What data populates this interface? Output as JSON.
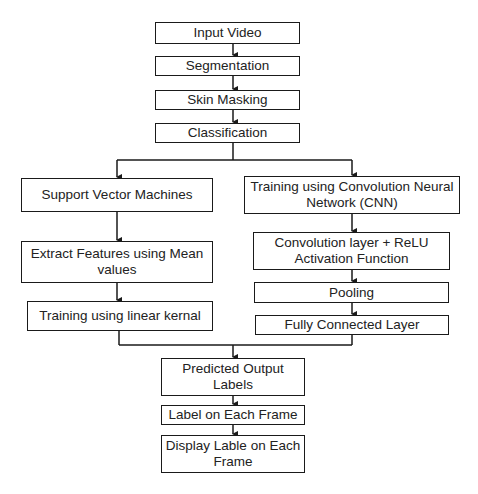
{
  "diagram": {
    "type": "flowchart",
    "nodes": {
      "input_video": "Input Video",
      "segmentation": "Segmentation",
      "skin_masking": "Skin Masking",
      "classification": "Classification",
      "svm": "Support Vector Machines",
      "extract_features": "Extract Features using Mean values",
      "linear_kernel": "Training using linear kernal",
      "cnn": "Training using Convolution Neural Network (CNN)",
      "conv_relu": "Convolution layer + ReLU Activation Function",
      "pooling": "Pooling",
      "fully_connected": "Fully Connected Layer",
      "predicted_labels": "Predicted Output Labels",
      "label_each_frame": "Label on Each Frame",
      "display_label": "Display Lable on Each Frame"
    },
    "edges": [
      [
        "input_video",
        "segmentation"
      ],
      [
        "segmentation",
        "skin_masking"
      ],
      [
        "skin_masking",
        "classification"
      ],
      [
        "classification",
        "svm"
      ],
      [
        "classification",
        "cnn"
      ],
      [
        "svm",
        "extract_features"
      ],
      [
        "extract_features",
        "linear_kernel"
      ],
      [
        "cnn",
        "conv_relu"
      ],
      [
        "conv_relu",
        "pooling"
      ],
      [
        "pooling",
        "fully_connected"
      ],
      [
        "linear_kernel",
        "predicted_labels"
      ],
      [
        "fully_connected",
        "predicted_labels"
      ],
      [
        "predicted_labels",
        "label_each_frame"
      ],
      [
        "label_each_frame",
        "display_label"
      ]
    ],
    "colors": {
      "stroke": "#1a1a1a",
      "fill": "#ffffff",
      "text": "#222222"
    }
  }
}
